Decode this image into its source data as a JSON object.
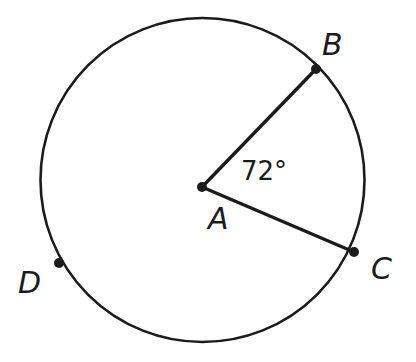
{
  "figure": {
    "background_color": "#ffffff",
    "stroke_color": "#1b1b1b",
    "text_color": "#1b1b1b",
    "width": 416,
    "height": 362
  },
  "circle": {
    "name": "circle-A",
    "center_x": 202.5,
    "center_y": 180,
    "radius": 162,
    "stroke_width": 2.6,
    "fill": "none"
  },
  "points": [
    {
      "id": "A",
      "label": "A",
      "role": "center",
      "x": 202,
      "y": 187,
      "dot_radius": 5,
      "label_x": 208,
      "label_y": 229
    },
    {
      "id": "B",
      "label": "B",
      "role": "on-circle",
      "x": 316,
      "y": 69,
      "dot_radius": 5,
      "label_x": 322,
      "label_y": 55
    },
    {
      "id": "C",
      "label": "C",
      "role": "on-circle",
      "x": 354,
      "y": 252,
      "dot_radius": 5,
      "label_x": 371,
      "label_y": 279
    },
    {
      "id": "D",
      "label": "D",
      "role": "on-circle",
      "x": 59,
      "y": 263,
      "dot_radius": 5,
      "label_x": 18,
      "label_y": 293
    }
  ],
  "segments": [
    {
      "id": "AB",
      "name": "radius-ab",
      "from": "A",
      "to": "B",
      "x1": 202,
      "y1": 187,
      "x2": 316,
      "y2": 69,
      "stroke_width": 3.4
    },
    {
      "id": "AC",
      "name": "radius-ac",
      "from": "A",
      "to": "C",
      "x1": 202,
      "y1": 187,
      "x2": 354,
      "y2": 252,
      "stroke_width": 3.4
    }
  ],
  "angles": [
    {
      "id": "BAC",
      "vertex": "A",
      "rays": [
        "B",
        "C"
      ],
      "value": 72,
      "unit": "degrees",
      "label": "72°",
      "label_x": 241,
      "label_y": 180
    }
  ]
}
